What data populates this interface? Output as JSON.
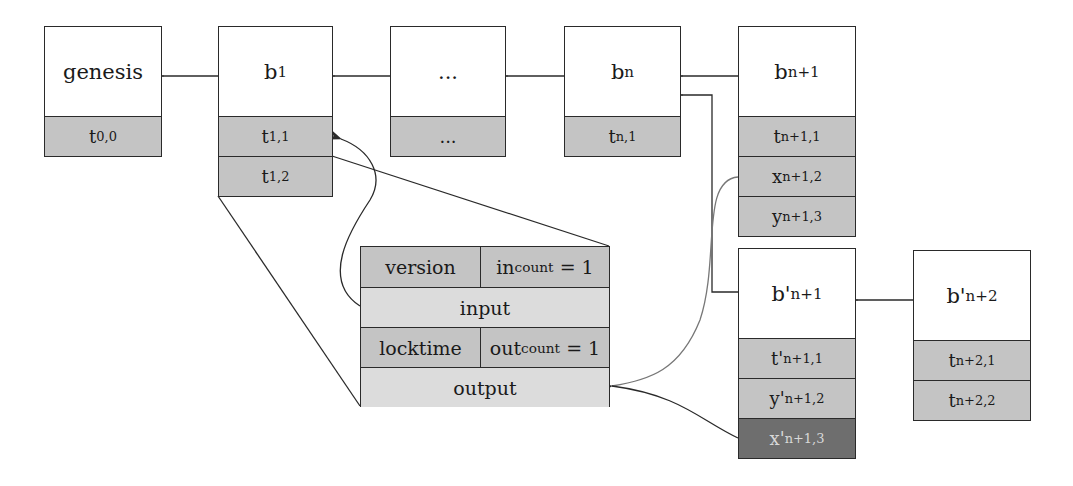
{
  "chain": {
    "genesis": {
      "label": "genesis",
      "txs": [
        {
          "base": "t",
          "sub": "0,0"
        }
      ]
    },
    "b1": {
      "base": "b",
      "sub": "1",
      "txs": [
        {
          "base": "t",
          "sub": "1,1"
        },
        {
          "base": "t",
          "sub": "1,2"
        }
      ]
    },
    "ellipsis": {
      "label": "...",
      "txs": [
        {
          "base": "...",
          "sub": ""
        }
      ]
    },
    "bn": {
      "base": "b",
      "sub": "n",
      "txs": [
        {
          "base": "t",
          "sub": "n,1"
        }
      ]
    },
    "bn1": {
      "base": "b",
      "sub": "n+1",
      "txs": [
        {
          "base": "t",
          "sub": "n+1,1"
        },
        {
          "base": "x",
          "sub": "n+1,2"
        },
        {
          "base": "y",
          "sub": "n+1,3"
        }
      ]
    }
  },
  "fork": {
    "bpn1": {
      "base": "b'",
      "sub": "n+1",
      "txs": [
        {
          "base": "t'",
          "sub": "n+1,1"
        },
        {
          "base": "y'",
          "sub": "n+1,2"
        },
        {
          "base": "x'",
          "sub": "n+1,3",
          "highlight": true
        }
      ]
    },
    "bpn2": {
      "base": "b'",
      "sub": "n+2",
      "txs": [
        {
          "base": "t",
          "sub": "n+2,1"
        },
        {
          "base": "t",
          "sub": "n+2,2"
        }
      ]
    }
  },
  "transaction": {
    "version": "version",
    "in_base": "in",
    "in_sub": "count",
    "in_val": "= 1",
    "input": "input",
    "locktime": "locktime",
    "out_base": "out",
    "out_sub": "count",
    "out_val": "= 1",
    "output": "output"
  },
  "colors": {
    "cell": "#c4c4c4",
    "light_cell": "#dcdcdc",
    "highlight": "#6e6e6e",
    "line": "#2a2a2a",
    "gray_line": "#777777"
  }
}
